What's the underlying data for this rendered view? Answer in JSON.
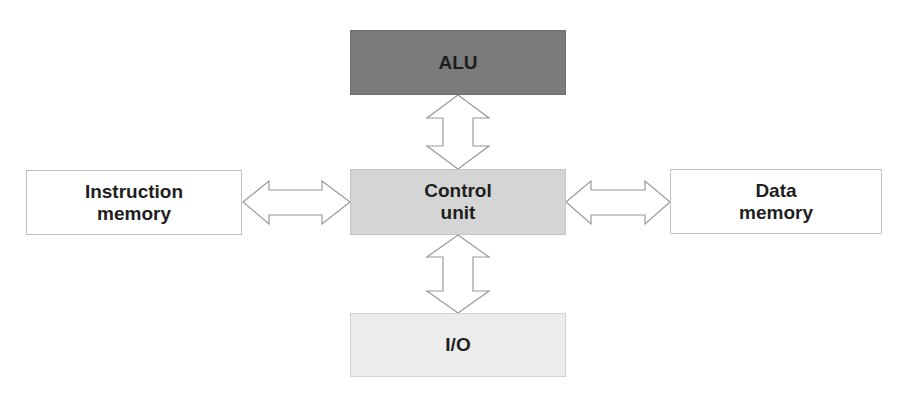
{
  "diagram": {
    "type": "block-diagram",
    "nodes": {
      "alu": {
        "label": "ALU",
        "fill": "#7b7b7b"
      },
      "control_unit": {
        "line1": "Control",
        "line2": "unit",
        "fill": "#d5d5d5"
      },
      "io": {
        "label": "I/O",
        "fill": "#ececec"
      },
      "instruction_memory": {
        "line1": "Instruction",
        "line2": "memory",
        "fill": "#ffffff"
      },
      "data_memory": {
        "line1": "Data",
        "line2": "memory",
        "fill": "#ffffff"
      }
    },
    "edges": [
      {
        "from": "control_unit",
        "to": "alu",
        "style": "double-headed-block-arrow"
      },
      {
        "from": "control_unit",
        "to": "io",
        "style": "double-headed-block-arrow"
      },
      {
        "from": "control_unit",
        "to": "instruction_memory",
        "style": "double-headed-block-arrow"
      },
      {
        "from": "control_unit",
        "to": "data_memory",
        "style": "double-headed-block-arrow"
      }
    ]
  }
}
